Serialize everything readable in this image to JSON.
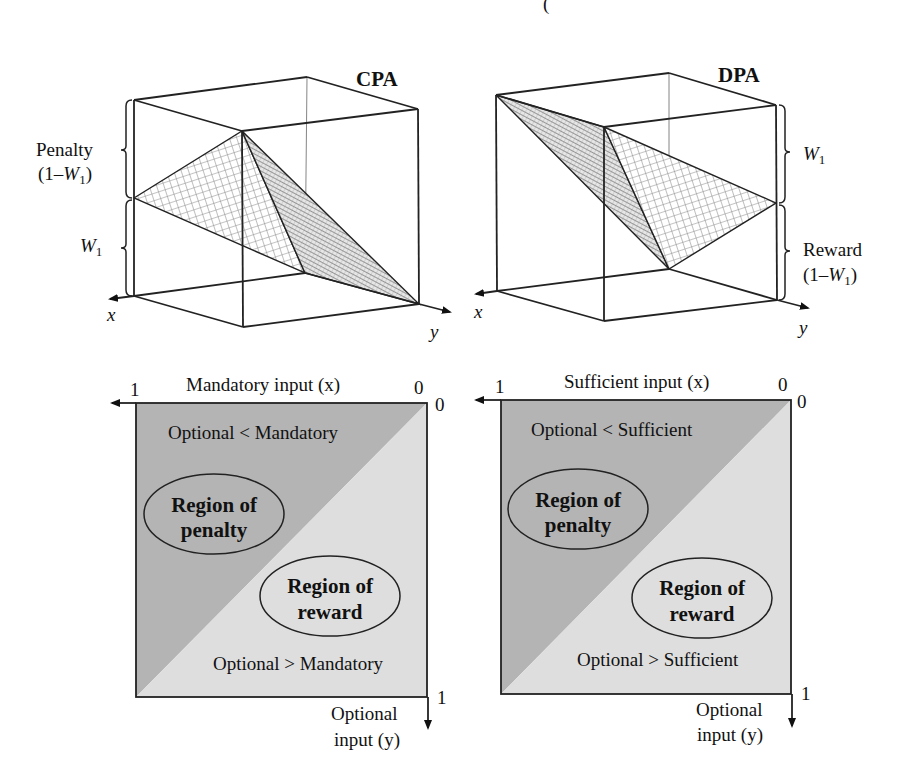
{
  "top_fragment": "(",
  "panels": {
    "cpa": {
      "title": "CPA",
      "axis_x": "x",
      "axis_y": "y",
      "brace_upper_label_line1": "Penalty",
      "brace_upper_label_line2_prefix": "(1–",
      "brace_upper_label_line2_var": "W",
      "brace_upper_label_line2_sub": "1",
      "brace_upper_label_line2_suffix": ")",
      "brace_lower_var": "W",
      "brace_lower_sub": "1"
    },
    "dpa": {
      "title": "DPA",
      "axis_x": "x",
      "axis_y": "y",
      "brace_upper_var": "W",
      "brace_upper_sub": "1",
      "brace_lower_label_line1": "Reward",
      "brace_lower_label_line2_prefix": "(1–",
      "brace_lower_label_line2_var": "W",
      "brace_lower_label_line2_sub": "1",
      "brace_lower_label_line2_suffix": ")"
    }
  },
  "squares": {
    "left": {
      "x_axis_label": "Mandatory input (x)",
      "x_axis_max": "1",
      "x_axis_origin": "0",
      "y_axis_origin": "0",
      "y_axis_max": "1",
      "y_axis_label_line1": "Optional",
      "y_axis_label_line2": "input (y)",
      "upper_region_text": "Optional < Mandatory",
      "lower_region_text": "Optional > Mandatory",
      "penalty_line1": "Region of",
      "penalty_line2": "penalty",
      "reward_line1": "Region of",
      "reward_line2": "reward"
    },
    "right": {
      "x_axis_label": "Sufficient input (x)",
      "x_axis_max": "1",
      "x_axis_origin": "0",
      "y_axis_origin": "0",
      "y_axis_max": "1",
      "y_axis_label_line1": "Optional",
      "y_axis_label_line2": "input (y)",
      "upper_region_text": "Optional < Sufficient",
      "lower_region_text": "Optional > Sufficient",
      "penalty_line1": "Region of",
      "penalty_line2": "penalty",
      "reward_line1": "Region of",
      "reward_line2": "reward"
    }
  },
  "colors": {
    "penalty_fill": "#b4b4b4",
    "reward_fill": "#dedede",
    "line": "#222222",
    "mesh": "#8a8a8a"
  }
}
